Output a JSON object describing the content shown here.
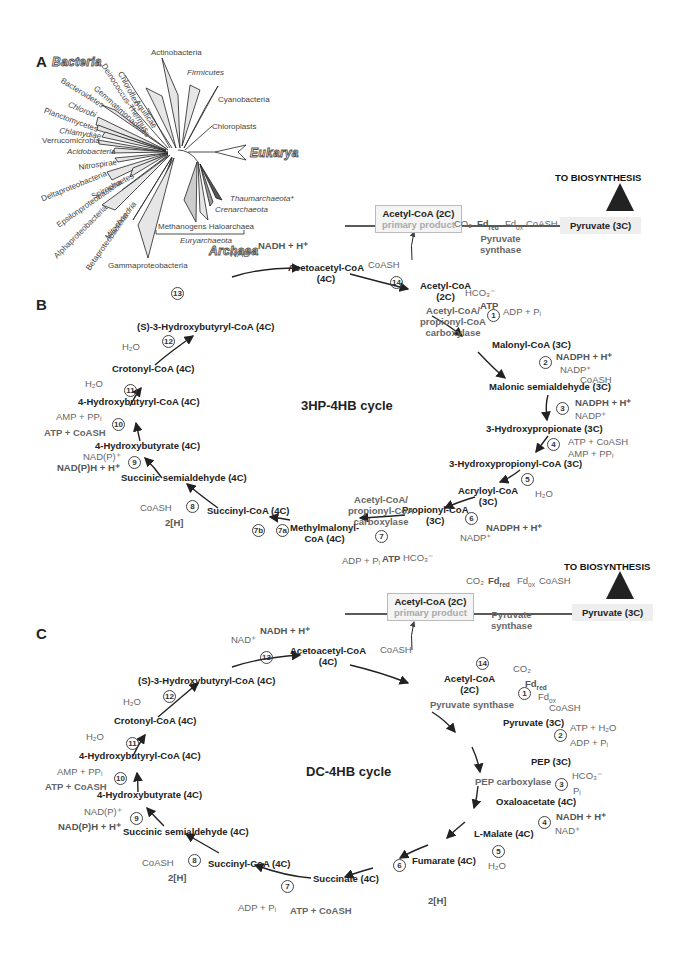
{
  "panels": {
    "A": {
      "label": "A",
      "domains": {
        "bacteria": "Bacteria",
        "eukarya": "Eukarya",
        "archaea": "Archaea"
      },
      "taxa": [
        "Actinobacteria",
        "Firmicutes",
        "Cyanobacteria",
        "Chloroplasts",
        "Chloroflexi",
        "Deinococcus-Thermus",
        "Aquificae",
        "Gemmatimonadetes",
        "Bacteroidetes",
        "Chlorobi",
        "Planctomycetes",
        "Chlamydiae",
        "Verrucomicrobia",
        "Acidobacteria",
        "Nitrospirae",
        "Deltaproteobacteria",
        "Spirochaetes",
        "Epsilonproteobacteria",
        "Alphaproteobacteria",
        "Mitochondria",
        "Betaproteobacteria",
        "Gammaproteobacteria",
        "Thaumarchaeota*",
        "Crenarchaeota",
        "Methanogens Haloarchaea",
        "Euryarchaeota"
      ]
    },
    "B": {
      "label": "B",
      "cycle_name": "3HP-4HB cycle",
      "metabolites": {
        "acetoacetyl": "Acetoacetyl-CoA",
        "acetoacetyl_c": "(4C)",
        "acetyl": "Acetyl-CoA",
        "acetyl_c": "(2C)",
        "malonyl": "Malonyl-CoA (3C)",
        "malonic": "Malonic semialdehyde (3C)",
        "hp": "3-Hydroxypropionate (3C)",
        "hpcoa": "3-Hydroxypropionyl-CoA (3C)",
        "acryloyl": "Acryloyl-CoA",
        "acryloyl_c": "(3C)",
        "propionyl": "Propionyl-CoA",
        "propionyl_c": "(3C)",
        "methylmalonyl": "Methylmalonyl-",
        "methylmalonyl_c": "CoA (4C)",
        "succinyl": "Succinyl-CoA (4C)",
        "ssa": "Succinic semialdehyde (4C)",
        "hb": "4-Hydroxybutyrate (4C)",
        "hbcoa": "4-Hydroxybutyryl-CoA (4C)",
        "crotonyl": "Crotonyl-CoA (4C)",
        "s3hb": "(S)-3-Hydroxybutyryl-CoA (4C)"
      },
      "enzymes": {
        "acc1": "Acetyl-CoA/",
        "acc2": "propionyl-CoA",
        "acc3": "carboxylase",
        "pcc1": "Acetyl-CoA/",
        "pcc2": "propionyl-CoA",
        "pcc3": "carboxylase",
        "pyr1": "Pyruvate",
        "pyr2": "synthase"
      },
      "cofactors": {
        "nad": "NAD⁺",
        "nadh": "NADH + H⁺",
        "coash14": "CoASH",
        "hco3_1": "HCO₃⁻",
        "atp1": "ATP",
        "adp1": "ADP + Pᵢ",
        "nadph2": "NADPH + H⁺",
        "nadp2": "NADP⁺",
        "coash2": "CoASH",
        "nadph3": "NADPH + H⁺",
        "nadp3": "NADP⁺",
        "atp4": "ATP + CoASH",
        "amp4": "AMP + PPᵢ",
        "h2o5": "H₂O",
        "nadph6": "NADPH + H⁺",
        "nadp6": "NADP⁺",
        "adp7": "ADP + Pᵢ",
        "atp7": "ATP",
        "hco3_7": "HCO₃⁻",
        "coash8": "CoASH",
        "h8": "2[H]",
        "nadp9": "NAD(P)⁺",
        "nadph9": "NAD(P)H + H⁺",
        "amp10": "AMP + PPᵢ",
        "atp10": "ATP + CoASH",
        "h2o11": "H₂O",
        "h2o12": "H₂O",
        "co2": "CO₂",
        "fdred": "Fd",
        "fdred_sub": "red",
        "fdox": "Fd",
        "fdox_sub": "ox",
        "coash_pyr": "CoASH"
      },
      "steps": [
        "1",
        "2",
        "3",
        "4",
        "5",
        "6",
        "7",
        "7a",
        "7b",
        "8",
        "9",
        "10",
        "11",
        "12",
        "13",
        "14"
      ],
      "product_box": {
        "title": "Acetyl-CoA (2C)",
        "subtitle": "primary product"
      },
      "pyruvate": "Pyruvate (3C)",
      "biosynthesis": "TO BIOSYNTHESIS"
    },
    "C": {
      "label": "C",
      "cycle_name": "DC-4HB cycle",
      "metabolites": {
        "acetoacetyl": "Acetoacetyl-CoA",
        "acetoacetyl_c": "(4C)",
        "acetyl": "Acetyl-CoA",
        "acetyl_c": "(2C)",
        "pyruvate": "Pyruvate (3C)",
        "pep": "PEP (3C)",
        "oaa": "Oxaloacetate (4C)",
        "malate": "L-Malate (4C)",
        "fumarate": "Fumarate (4C)",
        "succinate": "Succinate (4C)",
        "succinyl": "Succinyl-CoA (4C)",
        "ssa": "Succinic semialdehyde (4C)",
        "hb": "4-Hydroxybutyrate (4C)",
        "hbcoa": "4-Hydroxybutyryl-CoA (4C)",
        "crotonyl": "Crotonyl-CoA (4C)",
        "s3hb": "(S)-3-Hydroxybutyryl-CoA (4C)"
      },
      "enzymes": {
        "pyrsyn": "Pyruvate synthase",
        "pepc": "PEP carboxylase",
        "pyr1": "Pyruvate",
        "pyr2": "synthase"
      },
      "cofactors": {
        "nad": "NAD⁺",
        "nadh": "NADH + H⁺",
        "coash14": "CoASH",
        "co2_1": "CO₂",
        "fdred1": "Fd",
        "fdox1": "Fd",
        "coash1": "CoASH",
        "atp2": "ATP + H₂O",
        "adp2": "ADP + Pᵢ",
        "hco3_3": "HCO₃⁻",
        "pi3": "Pᵢ",
        "nadh4": "NADH + H⁺",
        "nad4": "NAD⁺",
        "h2o5": "H₂O",
        "h6": "2[H]",
        "adp7": "ADP + Pᵢ",
        "atp7": "ATP + CoASH",
        "coash8": "CoASH",
        "h8": "2[H]",
        "nadp9": "NAD(P)⁺",
        "nadph9": "NAD(P)H + H⁺",
        "amp10": "AMP + PPᵢ",
        "atp10": "ATP + CoASH",
        "h2o11": "H₂O",
        "h2o12": "H₂O",
        "co2": "CO₂",
        "fdred": "Fd",
        "fdred_sub": "red",
        "fdox": "Fd",
        "fdox_sub": "ox",
        "coash_pyr": "CoASH"
      },
      "steps": [
        "1",
        "2",
        "3",
        "4",
        "5",
        "6",
        "7",
        "8",
        "9",
        "10",
        "11",
        "12",
        "13",
        "14"
      ],
      "product_box": {
        "title": "Acetyl-CoA (2C)",
        "subtitle": "primary product"
      },
      "pyruvate": "Pyruvate (3C)",
      "biosynthesis": "TO BIOSYNTHESIS"
    }
  }
}
